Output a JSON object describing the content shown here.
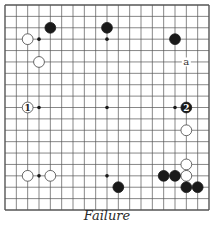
{
  "diagram": {
    "type": "go-board",
    "size": 19,
    "caption": "Failure",
    "colors": {
      "background": "#ffffff",
      "grid": "#555555",
      "black_stone": "#1a1a1a",
      "white_stone": "#ffffff",
      "white_stone_outline": "#444444"
    },
    "star_points": [
      [
        3,
        3
      ],
      [
        9,
        3
      ],
      [
        15,
        3
      ],
      [
        3,
        9
      ],
      [
        9,
        9
      ],
      [
        15,
        9
      ],
      [
        3,
        15
      ],
      [
        9,
        15
      ],
      [
        15,
        15
      ]
    ],
    "stones": [
      {
        "color": "black",
        "col": 4,
        "row": 2,
        "label": ""
      },
      {
        "color": "black",
        "col": 9,
        "row": 2,
        "label": ""
      },
      {
        "color": "black",
        "col": 15,
        "row": 3,
        "label": ""
      },
      {
        "color": "white",
        "col": 2,
        "row": 3,
        "label": ""
      },
      {
        "color": "white",
        "col": 3,
        "row": 5,
        "label": ""
      },
      {
        "color": "white",
        "col": 2,
        "row": 9,
        "label": "1"
      },
      {
        "color": "black",
        "col": 16,
        "row": 9,
        "label": "2"
      },
      {
        "color": "white",
        "col": 16,
        "row": 11,
        "label": ""
      },
      {
        "color": "white",
        "col": 16,
        "row": 14,
        "label": ""
      },
      {
        "color": "white",
        "col": 16,
        "row": 15,
        "label": ""
      },
      {
        "color": "black",
        "col": 14,
        "row": 15,
        "label": ""
      },
      {
        "color": "black",
        "col": 15,
        "row": 15,
        "label": ""
      },
      {
        "color": "black",
        "col": 16,
        "row": 16,
        "label": ""
      },
      {
        "color": "black",
        "col": 17,
        "row": 16,
        "label": ""
      },
      {
        "color": "black",
        "col": 10,
        "row": 16,
        "label": ""
      },
      {
        "color": "white",
        "col": 2,
        "row": 15,
        "label": ""
      },
      {
        "color": "white",
        "col": 4,
        "row": 15,
        "label": ""
      }
    ],
    "marks": [
      {
        "col": 16,
        "row": 5,
        "label": "a"
      }
    ]
  }
}
